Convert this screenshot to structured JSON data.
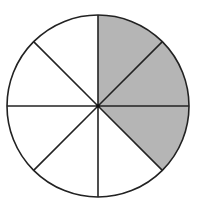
{
  "diagram": {
    "type": "fraction-circle",
    "total_sectors": 8,
    "shaded_sectors": 3,
    "shaded_indices_clockwise_from_top": [
      0,
      1,
      2
    ],
    "fraction_shaded": "3/8",
    "colors": {
      "shade": "#b5b5b5",
      "line": "#222222",
      "background": "#ffffff"
    }
  }
}
